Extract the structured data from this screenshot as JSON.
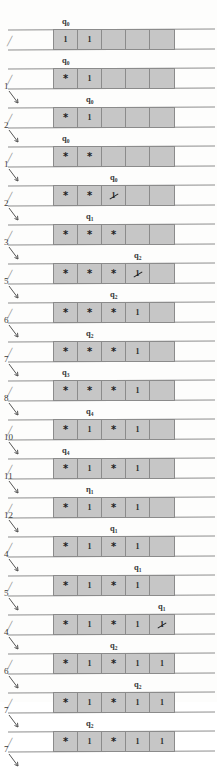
{
  "figure": {
    "scan_header": "",
    "cell_count": 5,
    "symbols": {
      "one": "1",
      "star": "*",
      "blank": ""
    }
  },
  "rows": [
    {
      "state": "q",
      "sub": "0",
      "position": "",
      "cells": [
        "1",
        "1",
        "",
        "",
        ""
      ],
      "marks": [
        "plain",
        "plain",
        "blank",
        "blank",
        "blank"
      ]
    },
    {
      "state": "q",
      "sub": "0",
      "position": "1",
      "cells": [
        "*",
        "1",
        "",
        "",
        ""
      ],
      "marks": [
        "star",
        "plain",
        "blank",
        "blank",
        "blank"
      ]
    },
    {
      "state": "q",
      "sub": "0",
      "position": "2",
      "cells": [
        "*",
        "1",
        "",
        "",
        ""
      ],
      "marks": [
        "star",
        "plain",
        "blank",
        "blank",
        "blank"
      ]
    },
    {
      "state": "q",
      "sub": "0",
      "position": "1",
      "cells": [
        "*",
        "*",
        "",
        "",
        ""
      ],
      "marks": [
        "star",
        "star",
        "blank",
        "blank",
        "blank"
      ]
    },
    {
      "state": "q",
      "sub": "0",
      "position": "2",
      "cells": [
        "*",
        "*",
        "1",
        "",
        ""
      ],
      "marks": [
        "star",
        "star",
        "struck",
        "blank",
        "blank"
      ]
    },
    {
      "state": "q",
      "sub": "1",
      "position": "3",
      "cells": [
        "*",
        "*",
        "*",
        "",
        ""
      ],
      "marks": [
        "star",
        "star",
        "star",
        "blank",
        "blank"
      ]
    },
    {
      "state": "q",
      "sub": "2",
      "position": "5",
      "cells": [
        "*",
        "*",
        "*",
        "1",
        ""
      ],
      "marks": [
        "star",
        "star",
        "star",
        "struck",
        "blank"
      ]
    },
    {
      "state": "q",
      "sub": "2",
      "position": "6",
      "cells": [
        "*",
        "*",
        "*",
        "1",
        ""
      ],
      "marks": [
        "star",
        "star",
        "star",
        "plain",
        "blank"
      ]
    },
    {
      "state": "q",
      "sub": "2",
      "position": "7",
      "cells": [
        "*",
        "*",
        "*",
        "1",
        ""
      ],
      "marks": [
        "star",
        "star",
        "star",
        "plain",
        "blank"
      ]
    },
    {
      "state": "q",
      "sub": "3",
      "position": "8",
      "cells": [
        "*",
        "*",
        "*",
        "1",
        ""
      ],
      "marks": [
        "star",
        "star",
        "star",
        "plain",
        "blank"
      ]
    },
    {
      "state": "q",
      "sub": "4",
      "position": "10",
      "cells": [
        "*",
        "1",
        "*",
        "1",
        ""
      ],
      "marks": [
        "star",
        "plain",
        "star",
        "plain",
        "blank"
      ]
    },
    {
      "state": "q",
      "sub": "4",
      "position": "11",
      "cells": [
        "*",
        "1",
        "*",
        "1",
        ""
      ],
      "marks": [
        "star",
        "plain",
        "star",
        "plain",
        "blank"
      ]
    },
    {
      "state": "η",
      "sub": "1",
      "position": "12",
      "cells": [
        "*",
        "1",
        "*",
        "1",
        ""
      ],
      "marks": [
        "star",
        "plain",
        "star",
        "plain",
        "blank"
      ]
    },
    {
      "state": "q",
      "sub": "1",
      "position": "4",
      "cells": [
        "*",
        "1",
        "*",
        "1",
        ""
      ],
      "marks": [
        "star",
        "plain",
        "star",
        "plain",
        "blank"
      ]
    },
    {
      "state": "q",
      "sub": "1",
      "position": "5",
      "cells": [
        "*",
        "1",
        "*",
        "1",
        ""
      ],
      "marks": [
        "star",
        "plain",
        "star",
        "plain",
        "blank"
      ]
    },
    {
      "state": "q",
      "sub": "1",
      "position": "4",
      "cells": [
        "*",
        "1",
        "*",
        "1",
        "1"
      ],
      "marks": [
        "star",
        "plain",
        "star",
        "plain",
        "struck"
      ]
    },
    {
      "state": "q",
      "sub": "2",
      "position": "6",
      "cells": [
        "*",
        "1",
        "*",
        "1",
        "1"
      ],
      "marks": [
        "star",
        "plain",
        "star",
        "plain",
        "plain"
      ]
    },
    {
      "state": "q",
      "sub": "2",
      "position": "7",
      "cells": [
        "*",
        "1",
        "*",
        "1",
        "1"
      ],
      "marks": [
        "star",
        "plain",
        "star",
        "plain",
        "plain"
      ]
    },
    {
      "state": "q",
      "sub": "2",
      "position": "7",
      "cells": [
        "*",
        "1",
        "*",
        "1",
        "1"
      ],
      "marks": [
        "star",
        "plain",
        "star",
        "plain",
        "plain"
      ]
    }
  ],
  "state_label_offsets": [
    62,
    62,
    86,
    62,
    110,
    86,
    134,
    110,
    86,
    62,
    86,
    62,
    86,
    110,
    134,
    158,
    110,
    134,
    86
  ]
}
